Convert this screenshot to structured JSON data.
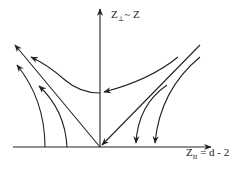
{
  "diagram": {
    "type": "flow diagram (RG flow)",
    "stroke_color": "#222222",
    "background": "#ffffff",
    "axes": {
      "vertical": {
        "label_main": "Z",
        "label_sub": "⊥",
        "label_rest": "~ Z",
        "full_label": "Z⊥ ~ Z"
      },
      "horizontal": {
        "label_main": "Z",
        "label_sub": "II",
        "label_rest": " = d - 2",
        "full_label": "Z∥ = d - 2"
      }
    },
    "flow_lines": [
      {
        "name": "parabola-flow",
        "direction": "from upper-right to upper-left through vertical axis"
      },
      {
        "name": "separatrix-left",
        "direction": "from origin to upper-left"
      },
      {
        "name": "separatrix-right",
        "direction": "from upper-right into origin"
      },
      {
        "name": "left-outer-curve",
        "direction": "from horizontal axis upward-left"
      },
      {
        "name": "left-inner-curve",
        "direction": "from horizontal axis upward-left"
      },
      {
        "name": "right-inner-curve",
        "direction": "from upper-right down to horizontal axis"
      },
      {
        "name": "right-outer-curve",
        "direction": "from upper-right down to horizontal axis"
      }
    ]
  }
}
